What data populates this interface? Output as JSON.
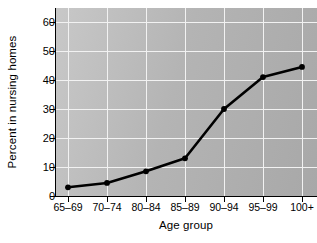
{
  "chart_data": {
    "type": "line",
    "title": "",
    "xlabel": "Age group",
    "ylabel": "Percent in nursing homes",
    "categories": [
      "65–69",
      "70–74",
      "80–84",
      "85–89",
      "90–94",
      "95–99",
      "100+"
    ],
    "values": [
      3,
      4.5,
      8.5,
      13,
      30,
      41,
      44.5
    ],
    "series": [
      {
        "name": "Percent in nursing homes",
        "values": [
          3,
          4.5,
          8.5,
          13,
          30,
          41,
          44.5
        ]
      }
    ],
    "ylim": [
      0,
      64
    ],
    "yticks": [
      0,
      10,
      20,
      30,
      40,
      50,
      60
    ],
    "ytick_labels": [
      "0",
      "10",
      "20",
      "30",
      "40",
      "50",
      "60"
    ],
    "grid": true,
    "legend": "none",
    "marker": "circle",
    "line_color": "#000000",
    "marker_color": "#000000",
    "plot_background": "#bfbfbf",
    "grid_color": "#f2f2f2",
    "figure_background": "#ffffff"
  },
  "axes": {
    "y_title": "Percent in nursing homes",
    "x_title": "Age group",
    "y_tick_labels": [
      "60",
      "50",
      "40",
      "30",
      "20",
      "10",
      "0"
    ],
    "x_tick_labels": [
      "65–69",
      "70–74",
      "80–84",
      "85–89",
      "90–94",
      "95–99",
      "100+"
    ]
  }
}
